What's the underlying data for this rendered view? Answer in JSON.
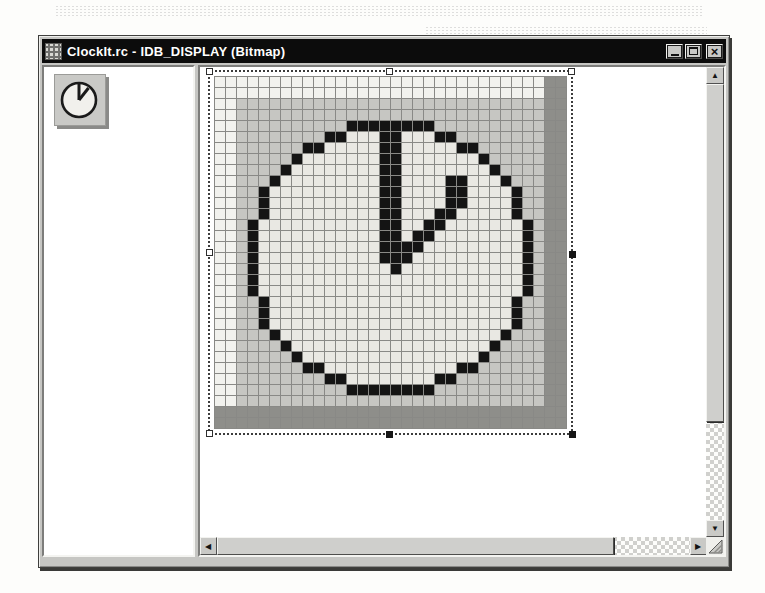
{
  "window": {
    "title": "ClockIt.rc - IDB_DISPLAY (Bitmap)",
    "titlebar_color": "#0c0c0c"
  },
  "icons": {
    "close_glyph": "×",
    "scroll_up": "▲",
    "scroll_down": "▼",
    "scroll_left": "◀",
    "scroll_right": "▶"
  },
  "thumbnail": {
    "name": "clock-bitmap-thumbnail",
    "face_color": "#f1f0ec",
    "line_color": "#1a1a1a"
  },
  "editor": {
    "bitmap": {
      "grid_size": 32,
      "cell_size": 11,
      "palette": {
        "w": "#f2f2ee",
        "g": "#c6c6c2",
        "d": "#8e8e8a",
        "B": "#141414",
        "f": "#e9e8e3"
      },
      "rows": [
        "wwwwwwwwwwwwwwwwwwwwwwwwwwwwwwdd",
        "wwwwwwwwwwwwwwwwwwwwwwwwwwwwwwdd",
        "wwggggggggggggggggggggggggggggdd",
        "wwggggggggggggggggggggggggggggdd",
        "wwggggggggggBBBBBBBBggggggggggdd",
        "wwggggggggBBfffBBfffBBggggggggdd",
        "wwggggggBBfffffBBfffffBBggggggdd",
        "wwgggggBfffffffBBfffffffBgggggdd",
        "wwggggBffffffffBBffffffffBggggdd",
        "wwgggBfffffffffBBffffBBfffBgggdd",
        "wwggBffffffffffBBffffBBffffBggdd",
        "wwggBffffffffffBBffffBBffffBggdd",
        "wwggBffffffffffBBfffBBfffffBggdd",
        "wwgBfffffffffffBBffBBfffffffBgdd",
        "wwgBfffffffffffBBfBBffffffffBgdd",
        "wwgBfffffffffffBBBBfffffffffBgdd",
        "wwgBfffffffffffBBBffffffffffBgdd",
        "wwgBffffffffffffBfffffffffffBgdd",
        "wwgBffffffffffffffffffffffffBgdd",
        "wwgBffffffffffffffffffffffffBgdd",
        "wwggBffffffffffffffffffffffBggdd",
        "wwggBffffffffffffffffffffffBggdd",
        "wwggBffffffffffffffffffffffBggdd",
        "wwgggBffffffffffffffffffffBgggdd",
        "wwggggBffffffffffffffffffBggggdd",
        "wwgggggBffffffffffffffffBgggggdd",
        "wwggggggBBffffffffffffBBggggggdd",
        "wwggggggggBBffffffffBBggggggggdd",
        "wwggggggggggBBBBBBBBggggggggggdd",
        "wwggggggggggggggggggggggggggggdd",
        "dddddddddddddddddddddddddddddddd",
        "dddddddddddddddddddddddddddddddd"
      ]
    },
    "selection": {
      "handles": [
        {
          "position": "top-left",
          "fill": "hollow"
        },
        {
          "position": "top-center",
          "fill": "hollow"
        },
        {
          "position": "top-right",
          "fill": "hollow"
        },
        {
          "position": "middle-left",
          "fill": "hollow"
        },
        {
          "position": "middle-right",
          "fill": "solid"
        },
        {
          "position": "bottom-left",
          "fill": "hollow"
        },
        {
          "position": "bottom-center",
          "fill": "solid"
        },
        {
          "position": "bottom-right",
          "fill": "solid"
        }
      ]
    },
    "scrollbars": {
      "vertical": {
        "thumb_start": 17,
        "thumb_length": 338
      },
      "horizontal": {
        "thumb_start": 17,
        "thumb_length": 397
      }
    }
  }
}
